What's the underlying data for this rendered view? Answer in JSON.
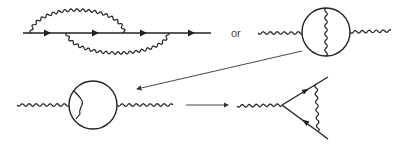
{
  "diagram": {
    "type": "feynman-diagrams",
    "separator_text": "or",
    "colors": {
      "line": "#222222",
      "arrow_connector": "#333333",
      "background": "#ffffff",
      "text": "#444444"
    },
    "panels": [
      {
        "id": "rainbow-fermion-line",
        "description": "Fermion line with four arrows and two overlapping wavy photon arcs (one above, one below)"
      },
      {
        "id": "photon-self-energy-vertical",
        "description": "Photon propagator with fermion loop and vertical internal photon line"
      },
      {
        "id": "photon-self-energy-vertex",
        "description": "Photon propagator with fermion loop and internal photon correction on left side"
      },
      {
        "id": "vertex-triangle",
        "description": "Photon attached to vertex with two arrowed fermion lines and wavy photon exchange"
      }
    ],
    "connectors": [
      {
        "from": "photon-self-energy-vertical",
        "to": "photon-self-energy-vertex"
      },
      {
        "from": "photon-self-energy-vertex",
        "to": "vertex-triangle"
      }
    ]
  }
}
